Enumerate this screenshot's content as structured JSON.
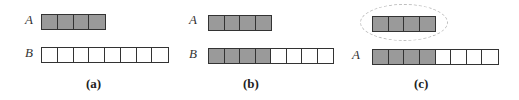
{
  "panels": [
    {
      "caption": "(a)",
      "rows": [
        {
          "label": "A",
          "filled": 4,
          "empty": 0
        },
        {
          "label": "B",
          "filled": 0,
          "empty": 8
        }
      ]
    },
    {
      "caption": "(b)",
      "rows": [
        {
          "label": "A",
          "filled": 4,
          "empty": 0
        },
        {
          "label": "B",
          "filled": 4,
          "empty": 4
        }
      ]
    },
    {
      "caption": "(c)",
      "rows": [
        {
          "label": "",
          "filled": 4,
          "empty": 0,
          "highlighted": true
        },
        {
          "label": "A",
          "filled": 4,
          "empty": 4
        }
      ]
    }
  ],
  "colors": {
    "filled": "#9a9a9a",
    "empty": "#ffffff",
    "border": "#333333",
    "ellipse": "#bdbdbd"
  }
}
